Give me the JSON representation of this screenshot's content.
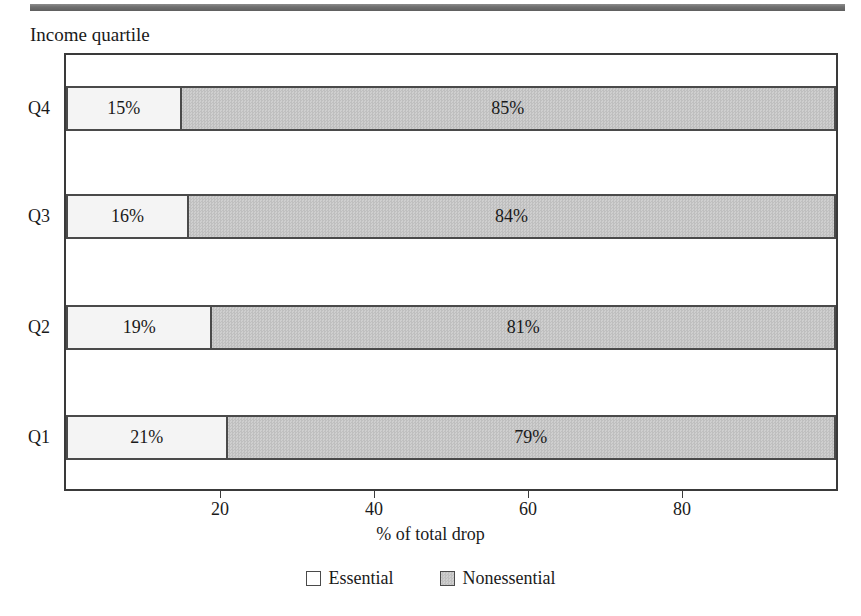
{
  "figure": {
    "y_axis_title": "Income quartile",
    "x_axis_title": "% of total drop"
  },
  "legend": {
    "items": [
      {
        "label": "Essential",
        "swatch": "white-square-icon",
        "color": "#ffffff"
      },
      {
        "label": "Nonessential",
        "swatch": "gray-square-icon",
        "color": "#c6c6c6"
      }
    ]
  },
  "chart_data": {
    "type": "bar",
    "orientation": "horizontal",
    "stacked": true,
    "normalized": true,
    "title": "",
    "subtitle": "",
    "xlabel": "% of total drop",
    "ylabel": "Income quartile",
    "xlim": [
      0,
      100
    ],
    "xticks": [
      20,
      40,
      60,
      80
    ],
    "xtick_labels": [
      "20",
      "40",
      "60",
      "80"
    ],
    "grid": false,
    "legend_position": "bottom-center",
    "categories": [
      "Q4",
      "Q3",
      "Q2",
      "Q1"
    ],
    "categories_bottom_to_top": [
      "Q1",
      "Q2",
      "Q3",
      "Q4"
    ],
    "series": [
      {
        "name": "Essential",
        "values": [
          15,
          16,
          19,
          21
        ],
        "labels": [
          "15%",
          "16%",
          "19%",
          "21%"
        ],
        "color": "#f4f4f4"
      },
      {
        "name": "Nonessential",
        "values": [
          85,
          84,
          81,
          79
        ],
        "labels": [
          "85%",
          "84%",
          "81%",
          "79%"
        ],
        "color": "#c6c6c6"
      }
    ],
    "rows": [
      {
        "category": "Q4",
        "essential": 15,
        "nonessential": 85,
        "essential_label": "15%",
        "nonessential_label": "85%"
      },
      {
        "category": "Q3",
        "essential": 16,
        "nonessential": 84,
        "essential_label": "16%",
        "nonessential_label": "84%"
      },
      {
        "category": "Q2",
        "essential": 19,
        "nonessential": 81,
        "essential_label": "19%",
        "nonessential_label": "81%"
      },
      {
        "category": "Q1",
        "essential": 21,
        "nonessential": 79,
        "essential_label": "21%",
        "nonessential_label": "79%"
      }
    ]
  },
  "axis": {
    "tick_labels": [
      "20",
      "40",
      "60",
      "80"
    ],
    "category_labels": [
      "Q4",
      "Q3",
      "Q2",
      "Q1"
    ]
  }
}
